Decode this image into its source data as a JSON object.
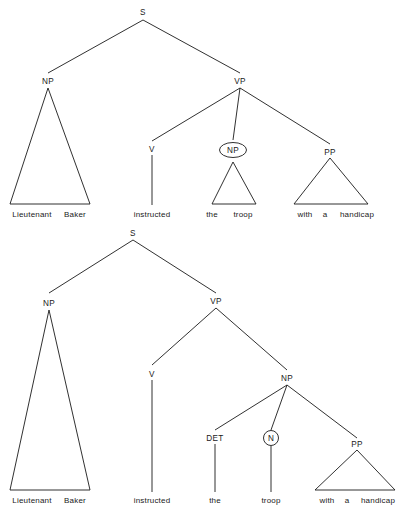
{
  "figure": {
    "type": "syntax-tree-diagram",
    "sentence": "Lieutenant Baker instructed the troop with a handicap",
    "tree_count": 2,
    "ink_color": "#1a1a1a",
    "background_color": "#ffffff"
  },
  "tree_top": {
    "name": "reading-1-pp-attaches-to-vp",
    "nodes": {
      "s": "S",
      "np_subject": "NP",
      "vp": "VP",
      "v": "V",
      "np_object": "NP",
      "pp": "PP"
    },
    "circled_nodes": [
      "np_object"
    ],
    "leaves": {
      "subject": "Lieutenant  Baker",
      "subject_word1": "Lieutenant",
      "subject_word2": "Baker",
      "verb": "instructed",
      "object": "the  troop",
      "object_word1": "the",
      "object_word2": "troop",
      "pp_phrase": "with  a  handicap",
      "pp_word1": "with",
      "pp_word2": "a",
      "pp_word3": "handicap"
    }
  },
  "tree_bottom": {
    "name": "reading-2-pp-attaches-to-np",
    "nodes": {
      "s": "S",
      "np_subject": "NP",
      "vp": "VP",
      "v": "V",
      "np_object": "NP",
      "det": "DET",
      "n": "N",
      "pp": "PP"
    },
    "circled_nodes": [
      "n"
    ],
    "leaves": {
      "subject": "Lieutenant  Baker",
      "subject_word1": "Lieutenant",
      "subject_word2": "Baker",
      "verb": "instructed",
      "det_word": "the",
      "n_word": "troop",
      "pp_phrase": "with  a  handicap",
      "pp_word1": "with",
      "pp_word2": "a",
      "pp_word3": "handicap"
    }
  }
}
